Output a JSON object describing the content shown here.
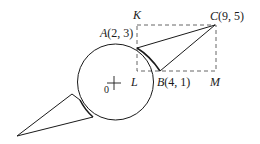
{
  "diagram": {
    "labels": {
      "K": "K",
      "C": "C",
      "C_coords": "(9, 5)",
      "A": "A",
      "A_coords": "(2, 3)",
      "L": "L",
      "B": "B",
      "B_coords": "(4, 1)",
      "M": "M",
      "origin": "0"
    },
    "colors": {
      "stroke": "#1a1a1a",
      "dashed": "#555555",
      "background": "#ffffff"
    }
  }
}
